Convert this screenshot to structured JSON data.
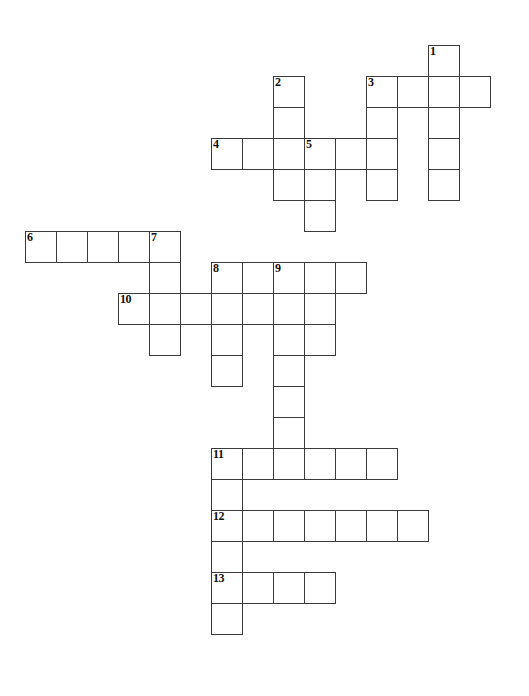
{
  "puzzle": {
    "title": "Crossword Puzzle Grid",
    "type": "crossword-grid",
    "cell_size": 31,
    "origin_x": 25,
    "origin_y": 45,
    "grid_cols": 16,
    "grid_rows": 21,
    "background_color": "#ffffff",
    "line_color": "#3a3a3a",
    "number_color": "#111111",
    "entries": [
      {
        "number": "1",
        "direction": "down",
        "col": 13,
        "row": 0,
        "length": 5
      },
      {
        "number": "2",
        "direction": "down",
        "col": 8,
        "row": 1,
        "length": 4
      },
      {
        "number": "3",
        "direction": "across",
        "col": 11,
        "row": 1,
        "length": 4
      },
      {
        "number": "3",
        "direction": "down",
        "col": 11,
        "row": 1,
        "length": 4
      },
      {
        "number": "4",
        "direction": "across",
        "col": 6,
        "row": 3,
        "length": 6
      },
      {
        "number": "5",
        "direction": "down",
        "col": 9,
        "row": 3,
        "length": 6
      },
      {
        "number": "6",
        "direction": "across",
        "col": 0,
        "row": 6,
        "length": 5
      },
      {
        "number": "7",
        "direction": "down",
        "col": 4,
        "row": 6,
        "length": 4
      },
      {
        "number": "8",
        "direction": "across",
        "col": 6,
        "row": 7,
        "length": 5
      },
      {
        "number": "8",
        "direction": "down",
        "col": 6,
        "row": 7,
        "length": 4
      },
      {
        "number": "9",
        "direction": "down",
        "col": 8,
        "row": 7,
        "length": 6
      },
      {
        "number": "10",
        "direction": "across",
        "col": 3,
        "row": 8,
        "length": 4
      },
      {
        "number": "11",
        "direction": "across",
        "col": 6,
        "row": 13,
        "length": 6
      },
      {
        "number": "12",
        "direction": "across",
        "col": 6,
        "row": 15,
        "length": 7
      },
      {
        "number": "13",
        "direction": "across",
        "col": 6,
        "row": 17,
        "length": 4
      },
      {
        "number": "11",
        "direction": "down",
        "col": 6,
        "row": 13,
        "length": 7
      }
    ],
    "cells": [
      {
        "col": 13,
        "row": 0,
        "num": "1"
      },
      {
        "col": 8,
        "row": 1,
        "num": "2"
      },
      {
        "col": 11,
        "row": 1,
        "num": "3"
      },
      {
        "col": 12,
        "row": 1,
        "num": ""
      },
      {
        "col": 13,
        "row": 1,
        "num": ""
      },
      {
        "col": 14,
        "row": 1,
        "num": ""
      },
      {
        "col": 8,
        "row": 2,
        "num": ""
      },
      {
        "col": 11,
        "row": 2,
        "num": ""
      },
      {
        "col": 13,
        "row": 2,
        "num": ""
      },
      {
        "col": 6,
        "row": 3,
        "num": "4"
      },
      {
        "col": 7,
        "row": 3,
        "num": ""
      },
      {
        "col": 8,
        "row": 3,
        "num": ""
      },
      {
        "col": 9,
        "row": 3,
        "num": "5"
      },
      {
        "col": 10,
        "row": 3,
        "num": ""
      },
      {
        "col": 11,
        "row": 3,
        "num": ""
      },
      {
        "col": 13,
        "row": 3,
        "num": ""
      },
      {
        "col": 8,
        "row": 4,
        "num": ""
      },
      {
        "col": 9,
        "row": 4,
        "num": ""
      },
      {
        "col": 11,
        "row": 4,
        "num": ""
      },
      {
        "col": 13,
        "row": 4,
        "num": ""
      },
      {
        "col": 9,
        "row": 5,
        "num": ""
      },
      {
        "col": 0,
        "row": 6,
        "num": "6"
      },
      {
        "col": 1,
        "row": 6,
        "num": ""
      },
      {
        "col": 2,
        "row": 6,
        "num": ""
      },
      {
        "col": 3,
        "row": 6,
        "num": ""
      },
      {
        "col": 4,
        "row": 6,
        "num": "7"
      },
      {
        "col": 4,
        "row": 7,
        "num": ""
      },
      {
        "col": 6,
        "row": 7,
        "num": "8"
      },
      {
        "col": 7,
        "row": 7,
        "num": ""
      },
      {
        "col": 8,
        "row": 7,
        "num": "9"
      },
      {
        "col": 9,
        "row": 7,
        "num": ""
      },
      {
        "col": 10,
        "row": 7,
        "num": ""
      },
      {
        "col": 3,
        "row": 8,
        "num": "10"
      },
      {
        "col": 4,
        "row": 8,
        "num": ""
      },
      {
        "col": 5,
        "row": 8,
        "num": ""
      },
      {
        "col": 6,
        "row": 8,
        "num": ""
      },
      {
        "col": 7,
        "row": 8,
        "num": ""
      },
      {
        "col": 8,
        "row": 8,
        "num": ""
      },
      {
        "col": 9,
        "row": 8,
        "num": ""
      },
      {
        "col": 4,
        "row": 9,
        "num": ""
      },
      {
        "col": 6,
        "row": 9,
        "num": ""
      },
      {
        "col": 8,
        "row": 9,
        "num": ""
      },
      {
        "col": 9,
        "row": 9,
        "num": ""
      },
      {
        "col": 6,
        "row": 10,
        "num": ""
      },
      {
        "col": 8,
        "row": 10,
        "num": ""
      },
      {
        "col": 8,
        "row": 11,
        "num": ""
      },
      {
        "col": 8,
        "row": 12,
        "num": ""
      },
      {
        "col": 6,
        "row": 13,
        "num": "11"
      },
      {
        "col": 7,
        "row": 13,
        "num": ""
      },
      {
        "col": 8,
        "row": 13,
        "num": ""
      },
      {
        "col": 9,
        "row": 13,
        "num": ""
      },
      {
        "col": 10,
        "row": 13,
        "num": ""
      },
      {
        "col": 11,
        "row": 13,
        "num": ""
      },
      {
        "col": 6,
        "row": 14,
        "num": ""
      },
      {
        "col": 6,
        "row": 15,
        "num": "12"
      },
      {
        "col": 7,
        "row": 15,
        "num": ""
      },
      {
        "col": 8,
        "row": 15,
        "num": ""
      },
      {
        "col": 9,
        "row": 15,
        "num": ""
      },
      {
        "col": 10,
        "row": 15,
        "num": ""
      },
      {
        "col": 11,
        "row": 15,
        "num": ""
      },
      {
        "col": 12,
        "row": 15,
        "num": ""
      },
      {
        "col": 6,
        "row": 16,
        "num": ""
      },
      {
        "col": 6,
        "row": 17,
        "num": "13"
      },
      {
        "col": 7,
        "row": 17,
        "num": ""
      },
      {
        "col": 8,
        "row": 17,
        "num": ""
      },
      {
        "col": 9,
        "row": 17,
        "num": ""
      },
      {
        "col": 6,
        "row": 18,
        "num": ""
      }
    ]
  }
}
